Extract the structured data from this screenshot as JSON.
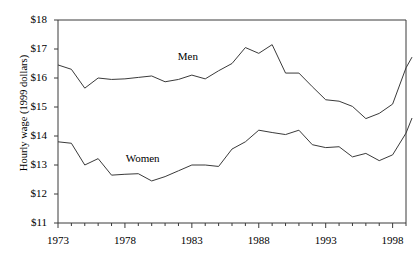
{
  "figure": {
    "title": "",
    "background_color": "#ffffff",
    "line_color": "#3a3a3a"
  },
  "chart_data": {
    "type": "line",
    "title": "",
    "xlabel": "",
    "ylabel": "Hourly wage (1999 dollars)",
    "xlim": [
      1973,
      1999
    ],
    "ylim": [
      11,
      18
    ],
    "grid": false,
    "legend": "inline-annotations",
    "ytick_labels": [
      "$18",
      "$17",
      "$16",
      "$15",
      "$14",
      "$13",
      "$12",
      "$11"
    ],
    "ytick_values": [
      18,
      17,
      16,
      15,
      14,
      13,
      12,
      11
    ],
    "xtick_labels": [
      "1973",
      "1978",
      "1983",
      "1988",
      "1993",
      "1998"
    ],
    "xtick_values": [
      1973,
      1978,
      1983,
      1988,
      1993,
      1998
    ],
    "x_minor_ticks": [
      1974,
      1975,
      1976,
      1977,
      1979,
      1980,
      1981,
      1982,
      1984,
      1985,
      1986,
      1987,
      1989,
      1990,
      1991,
      1992,
      1994,
      1995,
      1996,
      1997,
      1999
    ],
    "x": [
      1973,
      1974,
      1975,
      1976,
      1977,
      1978,
      1979,
      1980,
      1981,
      1982,
      1983,
      1984,
      1985,
      1986,
      1987,
      1988,
      1989,
      1990,
      1991,
      1992,
      1993,
      1994,
      1995,
      1996,
      1997,
      1998,
      1999
    ],
    "series": [
      {
        "name": "Men",
        "label_x": 1983.0,
        "label_y": 16.72,
        "values": [
          16.45,
          16.3,
          15.65,
          16.0,
          15.95,
          15.97,
          16.02,
          16.07,
          15.87,
          15.95,
          16.1,
          15.97,
          16.25,
          16.5,
          17.05,
          16.85,
          17.15,
          16.17,
          16.17,
          15.7,
          15.25,
          15.2,
          15.02,
          14.6,
          14.78,
          15.1,
          16.35
        ]
      },
      {
        "name": "Women",
        "label_x": 1979.1,
        "label_y": 13.2,
        "values": [
          13.8,
          13.75,
          13.0,
          13.22,
          12.65,
          12.68,
          12.7,
          12.45,
          12.6,
          12.8,
          13.0,
          13.0,
          12.95,
          13.55,
          13.8,
          14.2,
          14.12,
          14.05,
          14.2,
          13.7,
          13.6,
          13.63,
          13.28,
          13.4,
          13.15,
          13.35,
          14.1
        ]
      }
    ],
    "series_end_points": [
      {
        "name": "Men",
        "x": 1999.45,
        "y": 16.72
      },
      {
        "name": "Women",
        "x": 1999.45,
        "y": 14.62
      }
    ]
  }
}
